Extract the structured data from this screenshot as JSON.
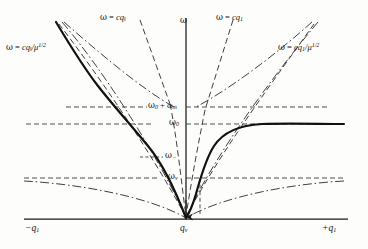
{
  "figure": {
    "kind": "dispersion-diagram"
  },
  "axes": {
    "vertical_axis_label": "ω",
    "x_left_label": "−q",
    "x_left_sub": "1",
    "x_center_label": "q",
    "x_center_sub": "v",
    "x_right_label": "+q",
    "x_right_sub": "1"
  },
  "asymptote_labels": {
    "top_left": {
      "lhs": "ω",
      "eq": " = ",
      "rhs": "cq",
      "sub": "‖",
      "den": "",
      "exp": ""
    },
    "top_center": {
      "lhs": "ω",
      "eq": " = ",
      "rhs": "cq",
      "sub": "‖",
      "den": "",
      "exp": ""
    },
    "top_right": {
      "lhs": "ω",
      "eq": " = ",
      "rhs": "cq",
      "sub": "1",
      "den": "",
      "exp": ""
    },
    "left_mu": {
      "lhs": "ω",
      "eq": " = ",
      "rhs": "cq",
      "sub": "‖",
      "den": "/μ",
      "exp": "1/2"
    },
    "right_mu": {
      "lhs": "ω",
      "eq": " = ",
      "rhs": "cq",
      "sub": "1",
      "den": "/μ",
      "exp": "1/2"
    }
  },
  "frequency_levels": [
    {
      "name": "omega0-plus-omegam",
      "text": "ω",
      "sub": "0",
      "suffix": " + ω",
      "suffix_sub": "m",
      "y": 107
    },
    {
      "name": "omega0",
      "text": "ω",
      "sub": "0",
      "suffix": "",
      "suffix_sub": "",
      "y": 124
    },
    {
      "name": "omega-minus",
      "text": "ω",
      "sub": "−",
      "suffix": "",
      "suffix_sub": "",
      "y": 157
    },
    {
      "name": "omega-v",
      "text": "ω",
      "sub": "v",
      "suffix": "",
      "suffix_sub": "",
      "y": 178
    }
  ],
  "colors": {
    "ink": "#1a1a1a",
    "curve": "#111111",
    "dashed": "#333333",
    "background": "#fdfdfc"
  },
  "geometry": {
    "origin_x": 186,
    "baseline_y": 219,
    "axis_top_y": 18,
    "axis_left_x": 24,
    "axis_right_x": 348
  }
}
